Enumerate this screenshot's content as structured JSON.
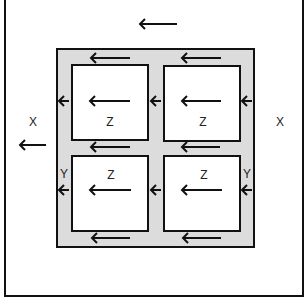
{
  "diagram": {
    "type": "flow-field",
    "colors": {
      "stroke": "#111111",
      "shaded_region": "#dcdcdc",
      "background": "#ffffff"
    },
    "labels": {
      "outer_left": "X",
      "outer_right": "X",
      "box_top_left": "Z",
      "box_top_right": "Z",
      "box_bottom_left": "Z",
      "box_bottom_right": "Z",
      "gray_left": "Y",
      "gray_right": "Y"
    },
    "arrow_direction": "left",
    "arrows": [
      {
        "x1": 177,
        "x2": 140,
        "y": 24,
        "region": "outer-top"
      },
      {
        "x1": 46,
        "x2": 20,
        "y": 145,
        "region": "outer-left"
      },
      {
        "x1": 130,
        "x2": 91,
        "y": 58,
        "region": "gray-top-left"
      },
      {
        "x1": 221,
        "x2": 182,
        "y": 58,
        "region": "gray-top-right"
      },
      {
        "x1": 69,
        "x2": 59,
        "y": 101,
        "region": "gray-left-upper"
      },
      {
        "x1": 161,
        "x2": 151,
        "y": 101,
        "region": "gray-middle-upper"
      },
      {
        "x1": 252,
        "x2": 242,
        "y": 101,
        "region": "gray-right-upper"
      },
      {
        "x1": 130,
        "x2": 90,
        "y": 101,
        "region": "box-top-left"
      },
      {
        "x1": 221,
        "x2": 182,
        "y": 101,
        "region": "box-top-right"
      },
      {
        "x1": 130,
        "x2": 91,
        "y": 147,
        "region": "gray-middle-left"
      },
      {
        "x1": 220,
        "x2": 182,
        "y": 147,
        "region": "gray-middle-right"
      },
      {
        "x1": 69,
        "x2": 59,
        "y": 190,
        "region": "gray-left-lower"
      },
      {
        "x1": 161,
        "x2": 151,
        "y": 190,
        "region": "gray-middle-lower"
      },
      {
        "x1": 252,
        "x2": 242,
        "y": 190,
        "region": "gray-right-lower"
      },
      {
        "x1": 131,
        "x2": 90,
        "y": 190,
        "region": "box-bottom-left"
      },
      {
        "x1": 222,
        "x2": 182,
        "y": 190,
        "region": "box-bottom-right"
      },
      {
        "x1": 130,
        "x2": 92,
        "y": 238,
        "region": "gray-bottom-left"
      },
      {
        "x1": 221,
        "x2": 183,
        "y": 238,
        "region": "gray-bottom-right"
      }
    ]
  }
}
